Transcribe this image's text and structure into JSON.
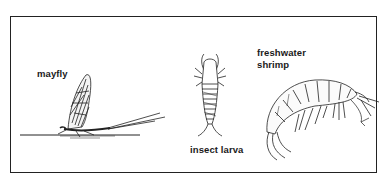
{
  "figure": {
    "labels": {
      "mayfly": "mayfly",
      "larva": "insect larva",
      "shrimp_line1": "freshwater",
      "shrimp_line2": "shrimp"
    },
    "colors": {
      "ink": "#222222",
      "background": "#ffffff"
    }
  }
}
